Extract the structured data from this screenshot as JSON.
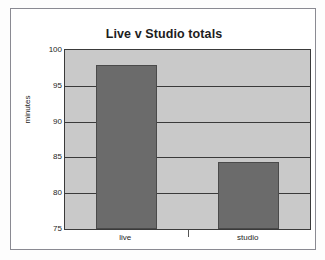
{
  "chart_data": {
    "type": "bar",
    "title": "Live v Studio totals",
    "xlabel": "",
    "ylabel": "minutes",
    "categories": [
      "live",
      "studio"
    ],
    "values": [
      97.9,
      84.4
    ],
    "ylim": [
      75,
      100
    ],
    "yticks": [
      100,
      95,
      90,
      85,
      80,
      75
    ],
    "ytick_labels": [
      "100",
      "95",
      "90",
      "85",
      "80",
      "75"
    ],
    "grid": true,
    "legend": false,
    "colors": {
      "bar_fill": "#6b6b6b",
      "bar_border": "#4a4a4a",
      "plot_background": "#c9c9c9",
      "gridline": "#3a3a3a",
      "axis_text": "#1d1d1d",
      "page_background": "#ffffff",
      "frame_border": "#8a8a92"
    }
  }
}
